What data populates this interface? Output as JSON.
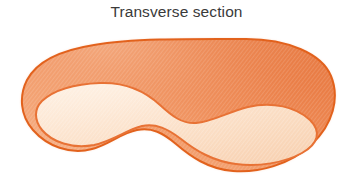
{
  "figure": {
    "title": "Transverse section",
    "type": "anatomical-cross-section-illustration",
    "background_color": "#ffffff",
    "title_color": "#3a3a3a",
    "canvas": {
      "width": 353,
      "height": 183
    }
  },
  "diagram": {
    "outer_region": {
      "name": "outer-cortex-region",
      "fill_color": "#ED8A55",
      "fill_color_light": "#F3A97D",
      "fill_color_dark": "#E57A43",
      "stroke_color": "#E2621F",
      "stroke_width": 2.0,
      "texture": "diagonal-hatch"
    },
    "inner_region": {
      "name": "inner-medulla-region",
      "fill_color": "#FBDCC2",
      "fill_color_light": "#FDEBD9",
      "stroke_color": "#E87235",
      "stroke_width": 2.0,
      "texture": "diagonal-hatch"
    },
    "shape_bounds": {
      "left": 22,
      "top": 38,
      "right": 335,
      "bottom": 172
    },
    "outline_path": "M 246 39 C 288 39 322 54 331 76 C 340 98 333 124 312 144 C 290 165 258 173 233 171 C 208 169 190 156 176 144 C 163 133 152 127 137 130 C 121 133 110 144 92 149 C 70 155 47 146 33 130 C 20 115 19 96 27 80 C 37 61 62 50 94 45 C 135 38 200 39 246 39 Z",
    "inner_path": "M 42 101 C 54 90 74 84 100 83 C 126 82 146 92 160 105 C 172 116 182 124 196 123 C 212 122 228 112 248 107 C 272 101 296 107 310 120 C 322 132 318 144 302 153 C 284 163 258 167 236 164 C 212 161 195 150 181 139 C 168 129 156 123 142 126 C 126 130 113 141 94 145 C 72 149 52 142 42 130 C 34 120 34 109 42 101 Z"
  },
  "labels": []
}
